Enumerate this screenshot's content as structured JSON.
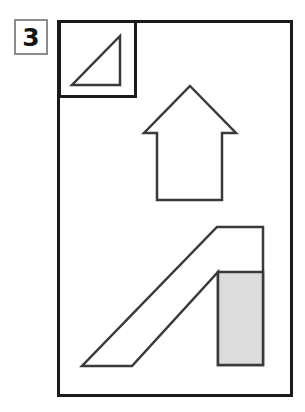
{
  "figure": {
    "label": "3",
    "label_box": {
      "x": 14,
      "y": 19,
      "width": 34,
      "height": 36,
      "border_color": "#8c8c8c"
    },
    "frame": {
      "name": "outer-frame",
      "x": 57,
      "y": 20,
      "width": 236,
      "height": 377,
      "stroke": "#1a1a1a",
      "stroke_width": 3,
      "fill": "#ffffff"
    },
    "inset_box": {
      "name": "inset-box",
      "x": 58,
      "y": 20,
      "width": 78,
      "height": 77,
      "stroke": "#1a1a1a",
      "stroke_width": 3,
      "fill": "#ffffff"
    },
    "shapes": [
      {
        "name": "right-triangle",
        "type": "polygon",
        "points": "120,36 120,85 72,85",
        "stroke": "#3a3a3a",
        "stroke_width": 2.5,
        "fill": "#ffffff"
      },
      {
        "name": "up-arrow",
        "type": "polygon",
        "points": "190,86 236,133 222,133 222,200 157,200 157,133 144,133",
        "stroke": "#3a3a3a",
        "stroke_width": 2.5,
        "fill": "#ffffff"
      },
      {
        "name": "ramp-outline",
        "type": "polygon",
        "points": "217,227 263,227 263,365 218,365 218,272 132,366 82,366",
        "stroke": "#3a3a3a",
        "stroke_width": 2.5,
        "fill": "#ffffff"
      },
      {
        "name": "shaded-rectangle",
        "type": "rect",
        "x": 218,
        "y": 272,
        "width": 45,
        "height": 93,
        "stroke": "#3a3a3a",
        "stroke_width": 2.5,
        "fill": "#dcdcdc"
      }
    ],
    "colors": {
      "background": "#ffffff",
      "outline": "#1a1a1a",
      "shape_outline": "#3a3a3a",
      "shading": "#dcdcdc",
      "label_border": "#8c8c8c",
      "label_text": "#151515"
    }
  }
}
